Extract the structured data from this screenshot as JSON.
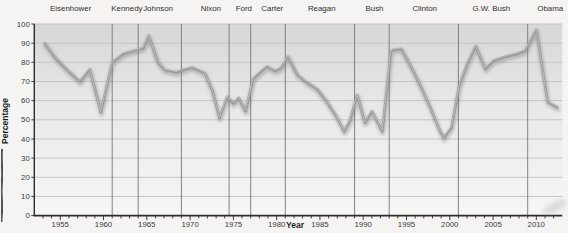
{
  "window": {
    "width": 568,
    "height": 233
  },
  "colors": {
    "page_background": "#f5f4f2",
    "plot_gradient_top": "#d7d7d6",
    "plot_gradient_mid": "#e9e9e8",
    "plot_gradient_bottom": "#f6f6f5",
    "gridline": "#c5c5c4",
    "divider_line": "#6f6f6f",
    "axis_line": "#2c2c2c",
    "series_line": "#9a9a9a",
    "series_line_shadow": "#6e6e6e",
    "series_line_highlight": "#c9c9c9",
    "tick_text": "#3a3a3a",
    "label_text": "#2f2f2f",
    "artifact_dark": "#1c1c1c",
    "artifact_smudge": "#8f8f8f"
  },
  "chart_data": {
    "type": "line",
    "xlabel": "Year",
    "ylabel": "Percentage",
    "xlim": [
      1952,
      2013
    ],
    "ylim": [
      0,
      100
    ],
    "y_ticks": [
      0,
      10,
      20,
      30,
      40,
      50,
      60,
      70,
      80,
      90,
      100
    ],
    "x_major_ticks": [
      1955,
      1960,
      1965,
      1970,
      1975,
      1980,
      1985,
      1990,
      1995,
      2000,
      2005,
      2010
    ],
    "x_minor_tick_start": 1953,
    "x_minor_tick_end": 2012,
    "grid": "horizontal",
    "legend": "none",
    "presidents": [
      {
        "name": "Eisenhower",
        "label_year": 1956.2,
        "divider_year": null
      },
      {
        "name": "Kennedy",
        "label_year": 1962.7,
        "divider_year": 1961
      },
      {
        "name": "Johnson",
        "label_year": 1966.3,
        "divider_year": 1964
      },
      {
        "name": "Nixon",
        "label_year": 1972.4,
        "divider_year": 1969
      },
      {
        "name": "Ford",
        "label_year": 1976.2,
        "divider_year": 1974.5
      },
      {
        "name": "Carter",
        "label_year": 1979.5,
        "divider_year": 1977
      },
      {
        "name": "Reagan",
        "label_year": 1985.2,
        "divider_year": 1981
      },
      {
        "name": "Bush",
        "label_year": 1991.3,
        "divider_year": 1989
      },
      {
        "name": "Clinton",
        "label_year": 1997.1,
        "divider_year": 1993
      },
      {
        "name": "G.W. Bush",
        "label_year": 2004.8,
        "divider_year": 2001
      },
      {
        "name": "Obama",
        "label_year": 2011.6,
        "divider_year": 2009
      }
    ],
    "series": [
      {
        "name": "Percentage",
        "points": [
          [
            1953.2,
            90
          ],
          [
            1954.5,
            82
          ],
          [
            1955.6,
            77
          ],
          [
            1956.9,
            71.5
          ],
          [
            1957.3,
            70
          ],
          [
            1958.4,
            76.5
          ],
          [
            1959.7,
            54
          ],
          [
            1961.0,
            80
          ],
          [
            1962.3,
            84.5
          ],
          [
            1963.5,
            86
          ],
          [
            1964.6,
            87.5
          ],
          [
            1965.2,
            94
          ],
          [
            1966.3,
            80
          ],
          [
            1967.1,
            76
          ],
          [
            1968.4,
            74.8
          ],
          [
            1969.4,
            76.3
          ],
          [
            1970.2,
            77.3
          ],
          [
            1971.7,
            74.5
          ],
          [
            1972.6,
            65
          ],
          [
            1973.4,
            51
          ],
          [
            1974.3,
            62
          ],
          [
            1975.0,
            58.5
          ],
          [
            1975.6,
            61.5
          ],
          [
            1976.4,
            54.5
          ],
          [
            1977.3,
            71.5
          ],
          [
            1978.0,
            74.5
          ],
          [
            1978.9,
            77.8
          ],
          [
            1979.8,
            75.5
          ],
          [
            1980.5,
            77
          ],
          [
            1981.3,
            83
          ],
          [
            1982.4,
            73.5
          ],
          [
            1983.5,
            69.5
          ],
          [
            1984.7,
            66
          ],
          [
            1985.8,
            59.5
          ],
          [
            1986.8,
            52.5
          ],
          [
            1987.8,
            44
          ],
          [
            1988.5,
            50
          ],
          [
            1989.3,
            63
          ],
          [
            1990.2,
            48.5
          ],
          [
            1991.0,
            54.5
          ],
          [
            1992.2,
            44
          ],
          [
            1993.2,
            85.5
          ],
          [
            1993.5,
            86.5
          ],
          [
            1994.4,
            87
          ],
          [
            1995.5,
            78
          ],
          [
            1996.6,
            68
          ],
          [
            1997.8,
            56
          ],
          [
            1998.7,
            46
          ],
          [
            1999.3,
            40.5
          ],
          [
            2000.2,
            46
          ],
          [
            2001.1,
            68
          ],
          [
            2002.0,
            79
          ],
          [
            2003.0,
            88.5
          ],
          [
            2004.1,
            76.5
          ],
          [
            2005.1,
            81
          ],
          [
            2006.5,
            83
          ],
          [
            2007.8,
            84.5
          ],
          [
            2008.7,
            86
          ],
          [
            2010.0,
            97
          ],
          [
            2011.3,
            59.5
          ],
          [
            2012.4,
            56.5
          ]
        ]
      }
    ]
  }
}
